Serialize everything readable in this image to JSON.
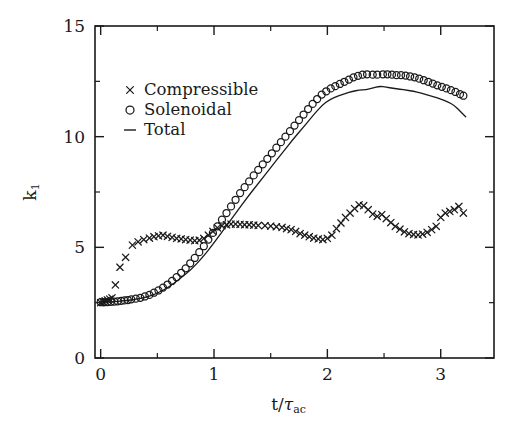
{
  "figure": {
    "background": "#ffffff",
    "ink_color": "#1a1a1a"
  },
  "axes": {
    "x_title": "t/",
    "x_title_tau": "τ",
    "x_title_sub": "ac",
    "y_title": "k",
    "y_title_sub": "1",
    "x_ticks": [
      "0",
      "1",
      "2",
      "3"
    ],
    "y_ticks": [
      "0",
      "5",
      "10",
      "15"
    ]
  },
  "legend": {
    "items": [
      {
        "marker": "x",
        "label": "Compressible"
      },
      {
        "marker": "o",
        "label": "Solenoidal"
      },
      {
        "marker": "−",
        "label": "Total"
      }
    ]
  },
  "chart_data": {
    "type": "scatter",
    "title": "",
    "xlabel": "t/τ_ac",
    "ylabel": "k_1",
    "xlim": [
      -0.05,
      3.47
    ],
    "ylim": [
      0,
      15
    ],
    "x_ticks": [
      0,
      1,
      2,
      3
    ],
    "y_ticks": [
      0,
      5,
      10,
      15
    ],
    "x_minor_ticks": [
      0.5,
      1.5,
      2.5
    ],
    "y_minor_ticks": [
      2.5,
      7.5,
      12.5
    ],
    "grid": false,
    "legend_position": "upper-left-inside",
    "series": [
      {
        "name": "Compressible",
        "marker": "x",
        "style": "points",
        "points": [
          [
            0.0,
            2.5
          ],
          [
            0.02,
            2.55
          ],
          [
            0.04,
            2.58
          ],
          [
            0.06,
            2.62
          ],
          [
            0.08,
            2.66
          ],
          [
            0.1,
            2.72
          ],
          [
            0.13,
            3.3
          ],
          [
            0.17,
            4.1
          ],
          [
            0.22,
            4.55
          ],
          [
            0.28,
            5.1
          ],
          [
            0.33,
            5.25
          ],
          [
            0.38,
            5.35
          ],
          [
            0.43,
            5.42
          ],
          [
            0.47,
            5.48
          ],
          [
            0.51,
            5.52
          ],
          [
            0.55,
            5.55
          ],
          [
            0.59,
            5.5
          ],
          [
            0.63,
            5.45
          ],
          [
            0.67,
            5.4
          ],
          [
            0.71,
            5.38
          ],
          [
            0.75,
            5.35
          ],
          [
            0.79,
            5.33
          ],
          [
            0.83,
            5.3
          ],
          [
            0.87,
            5.32
          ],
          [
            0.91,
            5.4
          ],
          [
            0.95,
            5.55
          ],
          [
            0.99,
            5.72
          ],
          [
            1.03,
            5.88
          ],
          [
            1.07,
            5.98
          ],
          [
            1.11,
            6.02
          ],
          [
            1.15,
            6.05
          ],
          [
            1.19,
            6.05
          ],
          [
            1.23,
            6.04
          ],
          [
            1.27,
            6.02
          ],
          [
            1.31,
            6.02
          ],
          [
            1.35,
            6.0
          ],
          [
            1.39,
            5.99
          ],
          [
            1.45,
            5.98
          ],
          [
            1.5,
            5.96
          ],
          [
            1.55,
            5.93
          ],
          [
            1.6,
            5.9
          ],
          [
            1.64,
            5.85
          ],
          [
            1.68,
            5.8
          ],
          [
            1.72,
            5.72
          ],
          [
            1.76,
            5.62
          ],
          [
            1.8,
            5.55
          ],
          [
            1.84,
            5.48
          ],
          [
            1.88,
            5.42
          ],
          [
            1.92,
            5.38
          ],
          [
            1.96,
            5.35
          ],
          [
            2.0,
            5.4
          ],
          [
            2.04,
            5.55
          ],
          [
            2.08,
            5.85
          ],
          [
            2.12,
            6.1
          ],
          [
            2.16,
            6.35
          ],
          [
            2.2,
            6.55
          ],
          [
            2.24,
            6.75
          ],
          [
            2.28,
            6.92
          ],
          [
            2.32,
            6.88
          ],
          [
            2.36,
            6.7
          ],
          [
            2.4,
            6.5
          ],
          [
            2.44,
            6.4
          ],
          [
            2.48,
            6.48
          ],
          [
            2.52,
            6.3
          ],
          [
            2.56,
            6.12
          ],
          [
            2.6,
            5.95
          ],
          [
            2.64,
            5.82
          ],
          [
            2.68,
            5.7
          ],
          [
            2.72,
            5.62
          ],
          [
            2.76,
            5.58
          ],
          [
            2.8,
            5.56
          ],
          [
            2.84,
            5.6
          ],
          [
            2.88,
            5.68
          ],
          [
            2.92,
            5.8
          ],
          [
            2.96,
            5.95
          ],
          [
            3.0,
            6.35
          ],
          [
            3.04,
            6.55
          ],
          [
            3.08,
            6.62
          ],
          [
            3.12,
            6.7
          ],
          [
            3.16,
            6.85
          ],
          [
            3.2,
            6.55
          ]
        ]
      },
      {
        "name": "Solenoidal",
        "marker": "o",
        "style": "points",
        "points": [
          [
            0.0,
            2.52
          ],
          [
            0.03,
            2.52
          ],
          [
            0.06,
            2.53
          ],
          [
            0.09,
            2.54
          ],
          [
            0.12,
            2.55
          ],
          [
            0.15,
            2.56
          ],
          [
            0.18,
            2.58
          ],
          [
            0.21,
            2.6
          ],
          [
            0.24,
            2.62
          ],
          [
            0.27,
            2.65
          ],
          [
            0.31,
            2.68
          ],
          [
            0.35,
            2.72
          ],
          [
            0.39,
            2.78
          ],
          [
            0.43,
            2.85
          ],
          [
            0.47,
            2.95
          ],
          [
            0.51,
            3.05
          ],
          [
            0.55,
            3.18
          ],
          [
            0.59,
            3.32
          ],
          [
            0.63,
            3.48
          ],
          [
            0.67,
            3.65
          ],
          [
            0.71,
            3.85
          ],
          [
            0.75,
            4.05
          ],
          [
            0.79,
            4.28
          ],
          [
            0.83,
            4.52
          ],
          [
            0.87,
            4.78
          ],
          [
            0.91,
            5.05
          ],
          [
            0.95,
            5.35
          ],
          [
            0.99,
            5.65
          ],
          [
            1.03,
            5.95
          ],
          [
            1.07,
            6.25
          ],
          [
            1.11,
            6.55
          ],
          [
            1.15,
            6.85
          ],
          [
            1.19,
            7.15
          ],
          [
            1.23,
            7.45
          ],
          [
            1.27,
            7.72
          ],
          [
            1.31,
            7.98
          ],
          [
            1.35,
            8.25
          ],
          [
            1.39,
            8.5
          ],
          [
            1.43,
            8.75
          ],
          [
            1.47,
            9.0
          ],
          [
            1.51,
            9.25
          ],
          [
            1.55,
            9.5
          ],
          [
            1.59,
            9.75
          ],
          [
            1.63,
            10.0
          ],
          [
            1.67,
            10.25
          ],
          [
            1.71,
            10.5
          ],
          [
            1.75,
            10.75
          ],
          [
            1.79,
            11.0
          ],
          [
            1.83,
            11.25
          ],
          [
            1.87,
            11.48
          ],
          [
            1.91,
            11.7
          ],
          [
            1.95,
            11.9
          ],
          [
            1.99,
            12.05
          ],
          [
            2.03,
            12.18
          ],
          [
            2.07,
            12.28
          ],
          [
            2.11,
            12.38
          ],
          [
            2.15,
            12.48
          ],
          [
            2.19,
            12.58
          ],
          [
            2.23,
            12.68
          ],
          [
            2.27,
            12.75
          ],
          [
            2.31,
            12.8
          ],
          [
            2.35,
            12.82
          ],
          [
            2.4,
            12.8
          ],
          [
            2.44,
            12.8
          ],
          [
            2.49,
            12.82
          ],
          [
            2.53,
            12.82
          ],
          [
            2.57,
            12.8
          ],
          [
            2.61,
            12.78
          ],
          [
            2.65,
            12.78
          ],
          [
            2.69,
            12.76
          ],
          [
            2.73,
            12.72
          ],
          [
            2.77,
            12.68
          ],
          [
            2.81,
            12.62
          ],
          [
            2.85,
            12.55
          ],
          [
            2.89,
            12.48
          ],
          [
            2.93,
            12.4
          ],
          [
            2.97,
            12.32
          ],
          [
            3.01,
            12.25
          ],
          [
            3.05,
            12.18
          ],
          [
            3.09,
            12.1
          ],
          [
            3.13,
            12.02
          ],
          [
            3.17,
            11.92
          ],
          [
            3.2,
            11.85
          ]
        ]
      },
      {
        "name": "Total",
        "marker": "-",
        "style": "line",
        "points": [
          [
            0.02,
            2.52
          ],
          [
            0.1,
            2.54
          ],
          [
            0.2,
            2.58
          ],
          [
            0.3,
            2.64
          ],
          [
            0.4,
            2.74
          ],
          [
            0.5,
            2.92
          ],
          [
            0.6,
            3.2
          ],
          [
            0.7,
            3.58
          ],
          [
            0.8,
            4.0
          ],
          [
            0.9,
            4.55
          ],
          [
            1.0,
            5.2
          ],
          [
            1.1,
            5.9
          ],
          [
            1.2,
            6.6
          ],
          [
            1.3,
            7.3
          ],
          [
            1.4,
            7.95
          ],
          [
            1.5,
            8.6
          ],
          [
            1.6,
            9.25
          ],
          [
            1.7,
            9.9
          ],
          [
            1.8,
            10.5
          ],
          [
            1.88,
            11.0
          ],
          [
            1.95,
            11.4
          ],
          [
            2.02,
            11.68
          ],
          [
            2.1,
            11.85
          ],
          [
            2.16,
            11.95
          ],
          [
            2.22,
            12.05
          ],
          [
            2.28,
            12.1
          ],
          [
            2.34,
            12.12
          ],
          [
            2.4,
            12.2
          ],
          [
            2.46,
            12.28
          ],
          [
            2.52,
            12.24
          ],
          [
            2.58,
            12.18
          ],
          [
            2.64,
            12.15
          ],
          [
            2.7,
            12.1
          ],
          [
            2.76,
            12.05
          ],
          [
            2.82,
            11.98
          ],
          [
            2.88,
            11.88
          ],
          [
            2.94,
            11.8
          ],
          [
            3.0,
            11.7
          ],
          [
            3.06,
            11.58
          ],
          [
            3.12,
            11.42
          ],
          [
            3.18,
            11.1
          ],
          [
            3.22,
            10.9
          ]
        ]
      }
    ]
  }
}
